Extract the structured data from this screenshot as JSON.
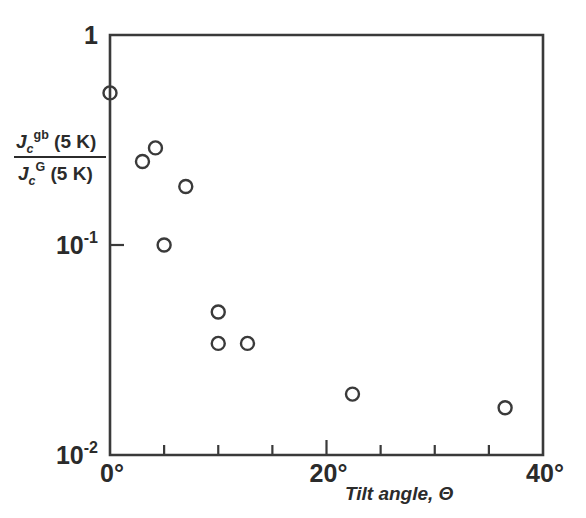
{
  "chart_data": {
    "type": "scatter",
    "title": "",
    "subtitle": "",
    "xlabel": "Tilt angle, Θ",
    "ylabel": "Jc gb (5 K) / Jc G (5 K)",
    "ylabel_parts": {
      "numerator_symbol": "J",
      "numerator_sub": "c",
      "numerator_sup": "gb",
      "numerator_rest": " (5 K)",
      "denominator_symbol": "J",
      "denominator_sub": "c",
      "denominator_sup": "G",
      "denominator_rest": " (5 K)"
    },
    "xlim": [
      0,
      40
    ],
    "ylim": [
      0.01,
      1
    ],
    "yscale": "log",
    "xscale": "linear",
    "grid": false,
    "legend": null,
    "x_tick_labels": [
      "0°",
      "20°",
      "40°"
    ],
    "x_tick_values": [
      0,
      20,
      40
    ],
    "x_minor_tick_values": [
      5,
      10,
      15,
      25,
      30,
      35
    ],
    "y_tick_labels": [
      "1",
      "10",
      "10"
    ],
    "y_tick_label_sups": [
      "",
      "-1",
      "-2"
    ],
    "y_tick_values": [
      1,
      0.1,
      0.01
    ],
    "marker_style": "open-circle",
    "marker_size_px": 13,
    "series": [
      {
        "name": "Jc ratio",
        "points": [
          {
            "x": 0.0,
            "y": 0.53
          },
          {
            "x": 3.0,
            "y": 0.25
          },
          {
            "x": 4.2,
            "y": 0.29
          },
          {
            "x": 5.0,
            "y": 0.1
          },
          {
            "x": 7.0,
            "y": 0.19
          },
          {
            "x": 10.0,
            "y": 0.048
          },
          {
            "x": 10.0,
            "y": 0.034
          },
          {
            "x": 12.7,
            "y": 0.034
          },
          {
            "x": 22.4,
            "y": 0.0195
          },
          {
            "x": 36.5,
            "y": 0.0168
          }
        ]
      }
    ]
  },
  "figure": {
    "plot_left_px": 110,
    "plot_right_px": 543,
    "plot_top_px": 35,
    "plot_bottom_px": 455,
    "axis_color": "#3a3a3a",
    "marker_color": "#3a3a3a",
    "background_color": "#ffffff"
  }
}
